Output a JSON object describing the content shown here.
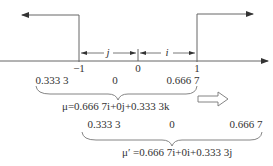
{
  "diagram": {
    "colors": {
      "stroke": "#555555",
      "text": "#333333",
      "background": "#ffffff"
    },
    "axis": {
      "ticks": [
        {
          "label": "−1",
          "x": 79
        },
        {
          "label": "0",
          "x": 138
        },
        {
          "label": "1",
          "x": 197
        }
      ]
    },
    "intervals": [
      {
        "label": "j",
        "from": "−1",
        "to": "0"
      },
      {
        "label": "i",
        "from": "0",
        "to": "1"
      }
    ],
    "row1": {
      "values": [
        "0.333 3",
        "0",
        "0.666 7"
      ],
      "formula": "μ=0.666 7i+0j+0.333 3k"
    },
    "row2": {
      "values": [
        "0.333 3",
        "0",
        "0.666 7"
      ],
      "formula": "μ′ =0.666 7i+0i+0.333 3j"
    },
    "transform_arrow": "hollow-right-arrow-icon"
  }
}
